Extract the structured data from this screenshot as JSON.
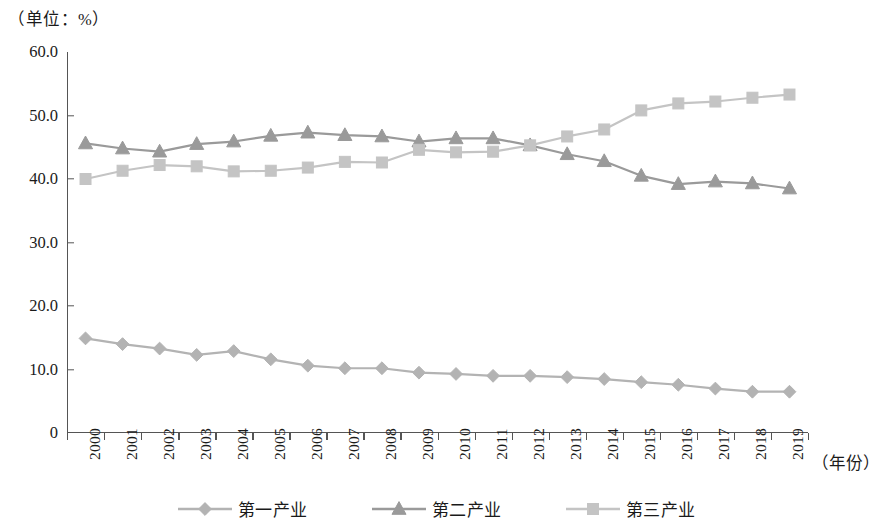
{
  "chart_data": {
    "type": "line",
    "title": "",
    "unit_caption": "（单位：%）",
    "xlabel": "（年份）",
    "ylabel": "",
    "ylim": [
      0,
      60
    ],
    "yticks": [
      "0",
      "10.0",
      "20.0",
      "30.0",
      "40.0",
      "50.0",
      "60.0"
    ],
    "ytick_values": [
      0,
      10,
      20,
      30,
      40,
      50,
      60
    ],
    "grid": false,
    "legend_position": "bottom",
    "categories": [
      "2000",
      "2001",
      "2002",
      "2003",
      "2004",
      "2005",
      "2006",
      "2007",
      "2008",
      "2009",
      "2010",
      "2011",
      "2012",
      "2013",
      "2014",
      "2015",
      "2016",
      "2017",
      "2018",
      "2019"
    ],
    "series": [
      {
        "name": "第一产业",
        "marker": "diamond",
        "color": "#b3b3b3",
        "values": [
          14.9,
          14.0,
          13.3,
          12.3,
          12.9,
          11.6,
          10.6,
          10.2,
          10.2,
          9.5,
          9.3,
          9.0,
          9.0,
          8.8,
          8.5,
          8.0,
          7.6,
          7.0,
          6.5,
          6.5
        ]
      },
      {
        "name": "第二产业",
        "marker": "triangle",
        "color": "#9a9a9a",
        "values": [
          45.6,
          44.8,
          44.3,
          45.5,
          45.9,
          46.8,
          47.3,
          46.9,
          46.7,
          45.9,
          46.4,
          46.4,
          45.3,
          43.9,
          42.8,
          40.5,
          39.2,
          39.6,
          39.3,
          38.5
        ]
      },
      {
        "name": "第三产业",
        "marker": "square",
        "color": "#c4c4c4",
        "values": [
          40.0,
          41.3,
          42.2,
          42.0,
          41.2,
          41.3,
          41.8,
          42.7,
          42.6,
          44.6,
          44.2,
          44.3,
          45.3,
          46.7,
          47.8,
          50.8,
          51.9,
          52.2,
          52.8,
          53.3
        ]
      }
    ]
  },
  "axis": {
    "line_color": "#555555"
  },
  "legend": {
    "items": [
      {
        "label": "第一产业"
      },
      {
        "label": "第二产业"
      },
      {
        "label": "第三产业"
      }
    ]
  }
}
